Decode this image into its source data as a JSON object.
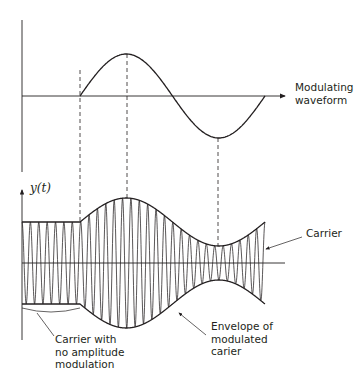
{
  "diagram": {
    "title": "Amplitude modulation",
    "colors": {
      "stroke": "#231f20",
      "background": "#ffffff"
    },
    "top_plot": {
      "label_line1": "Modulating",
      "label_line2": "waveform",
      "axis": {
        "x0": 22,
        "y_top": 20,
        "y_bottom": 172,
        "baseline_y": 96,
        "x_end": 285
      },
      "sine": {
        "x_start": 80,
        "x_end": 265,
        "amplitude_px": 42
      }
    },
    "bottom_plot": {
      "y_axis_label": "y(t)",
      "axis": {
        "x0": 22,
        "y_top": 188,
        "y_bottom": 340,
        "baseline_y": 263,
        "x_end": 285
      },
      "carrier": {
        "x_start": 22,
        "x_mod_start": 80,
        "x_end": 265,
        "cycles": 29,
        "base_amplitude_px": 41,
        "mod_depth_px": 24
      },
      "annotations": {
        "carrier": "Carrier",
        "no_mod_line1": "Carrier with",
        "no_mod_line2": "no amplitude",
        "no_mod_line3": "modulation",
        "envelope_line1": "Envelope of",
        "envelope_line2": "modulated",
        "envelope_line3": "carier"
      }
    },
    "guides": {
      "x_positions": [
        80,
        127,
        218
      ]
    }
  }
}
